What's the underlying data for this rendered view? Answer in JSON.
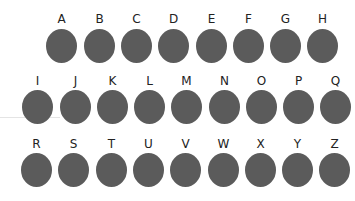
{
  "rows": [
    {
      "label_top": 13,
      "dot_top": 29,
      "items": [
        {
          "letter": "A",
          "x": 46
        },
        {
          "letter": "B",
          "x": 84
        },
        {
          "letter": "C",
          "x": 121
        },
        {
          "letter": "D",
          "x": 158
        },
        {
          "letter": "E",
          "x": 196
        },
        {
          "letter": "F",
          "x": 233
        },
        {
          "letter": "G",
          "x": 270
        },
        {
          "letter": "H",
          "x": 307
        }
      ]
    },
    {
      "label_top": 75,
      "dot_top": 90,
      "items": [
        {
          "letter": "I",
          "x": 22
        },
        {
          "letter": "J",
          "x": 60
        },
        {
          "letter": "K",
          "x": 97
        },
        {
          "letter": "L",
          "x": 134
        },
        {
          "letter": "M",
          "x": 171
        },
        {
          "letter": "N",
          "x": 209
        },
        {
          "letter": "O",
          "x": 246
        },
        {
          "letter": "P",
          "x": 283
        },
        {
          "letter": "Q",
          "x": 320
        }
      ]
    },
    {
      "label_top": 138,
      "dot_top": 153,
      "items": [
        {
          "letter": "R",
          "x": 21
        },
        {
          "letter": "S",
          "x": 58
        },
        {
          "letter": "T",
          "x": 96
        },
        {
          "letter": "U",
          "x": 133
        },
        {
          "letter": "V",
          "x": 170
        },
        {
          "letter": "W",
          "x": 208
        },
        {
          "letter": "X",
          "x": 245
        },
        {
          "letter": "Y",
          "x": 282
        },
        {
          "letter": "Z",
          "x": 319
        }
      ]
    }
  ],
  "colors": {
    "dot": "#5b5b5b",
    "label": "#222222",
    "background": "#ffffff"
  }
}
